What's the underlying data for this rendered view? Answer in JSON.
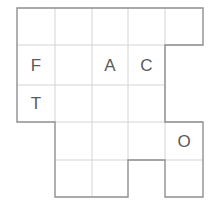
{
  "puzzle": {
    "type": "letter-grid-polyomino",
    "grid": {
      "column_edges_px": [
        17,
        55,
        92,
        128,
        165,
        203
      ],
      "row_edges_px": [
        8,
        45,
        85,
        122,
        160,
        197
      ],
      "cell_width_px": 38,
      "cell_height_px": 38
    },
    "colors": {
      "outline": "#8a8a8a",
      "inner_grid": "#d0d0d0",
      "letter": "#5a5a5a",
      "background": "#ffffff"
    },
    "cells": [
      {
        "id": "r0c0",
        "row": 0,
        "col": 0,
        "letter": ""
      },
      {
        "id": "r0c1",
        "row": 0,
        "col": 1,
        "letter": ""
      },
      {
        "id": "r0c2",
        "row": 0,
        "col": 2,
        "letter": ""
      },
      {
        "id": "r0c3",
        "row": 0,
        "col": 3,
        "letter": ""
      },
      {
        "id": "r0c4",
        "row": 0,
        "col": 4,
        "letter": ""
      },
      {
        "id": "r1c0",
        "row": 1,
        "col": 0,
        "letter": "F"
      },
      {
        "id": "r1c1",
        "row": 1,
        "col": 1,
        "letter": ""
      },
      {
        "id": "r1c2",
        "row": 1,
        "col": 2,
        "letter": "A"
      },
      {
        "id": "r1c3",
        "row": 1,
        "col": 3,
        "letter": "C"
      },
      {
        "id": "r2c0",
        "row": 2,
        "col": 0,
        "letter": "T"
      },
      {
        "id": "r2c1",
        "row": 2,
        "col": 1,
        "letter": ""
      },
      {
        "id": "r2c2",
        "row": 2,
        "col": 2,
        "letter": ""
      },
      {
        "id": "r2c3",
        "row": 2,
        "col": 3,
        "letter": ""
      },
      {
        "id": "r3c1",
        "row": 3,
        "col": 1,
        "letter": ""
      },
      {
        "id": "r3c2",
        "row": 3,
        "col": 2,
        "letter": ""
      },
      {
        "id": "r3c3",
        "row": 3,
        "col": 3,
        "letter": ""
      },
      {
        "id": "r3c4",
        "row": 3,
        "col": 4,
        "letter": "O"
      },
      {
        "id": "r4c1",
        "row": 4,
        "col": 1,
        "letter": ""
      },
      {
        "id": "r4c2",
        "row": 4,
        "col": 2,
        "letter": ""
      },
      {
        "id": "r4c4",
        "row": 4,
        "col": 4,
        "letter": ""
      }
    ],
    "letters_placed": [
      {
        "letter": "F",
        "row": 1,
        "col": 0
      },
      {
        "letter": "A",
        "row": 1,
        "col": 2
      },
      {
        "letter": "C",
        "row": 1,
        "col": 3
      },
      {
        "letter": "T",
        "row": 2,
        "col": 0
      },
      {
        "letter": "O",
        "row": 3,
        "col": 4
      }
    ]
  }
}
